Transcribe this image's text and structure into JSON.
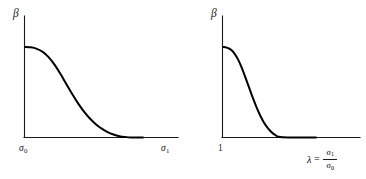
{
  "figure": {
    "background_color": "#ffffff",
    "ink_color": "#000000",
    "panel_count": 2
  },
  "panels": [
    {
      "id": "left",
      "y_axis_label": "β",
      "x_axis_start_label": "σ",
      "x_axis_start_label_sub": "0",
      "x_axis_end_label": "σ",
      "x_axis_end_label_sub": "1"
    },
    {
      "id": "right",
      "y_axis_label": "β",
      "x_axis_start_label": "1",
      "x_axis_expression": {
        "variable": "λ",
        "equals": "=",
        "numerator": "σ",
        "numerator_sub": "1",
        "denominator": "σ",
        "denominator_sub": "0"
      }
    }
  ],
  "chart_data": [
    {
      "type": "line",
      "id": "beta-vs-sigma",
      "title": "",
      "xlabel": "σ",
      "ylabel": "β",
      "xlim": [
        0,
        1
      ],
      "ylim": [
        0,
        1
      ],
      "grid": false,
      "legend": "none",
      "xtick_labels": [
        "σ₀",
        "σ₁"
      ],
      "xtick_values": [
        0,
        1
      ],
      "ytick_labels": [],
      "annotations": [],
      "series": [
        {
          "name": "β",
          "description": "smooth sigmoid (ogive) decay from a plateau near σ₀ to zero before σ₁",
          "x": [
            0.0,
            0.05,
            0.1,
            0.15,
            0.2,
            0.25,
            0.3,
            0.35,
            0.4,
            0.45,
            0.5,
            0.55,
            0.6,
            0.65,
            0.7,
            0.75,
            0.8,
            0.85,
            0.9,
            1.0
          ],
          "y": [
            0.745,
            0.742,
            0.73,
            0.705,
            0.662,
            0.6,
            0.524,
            0.441,
            0.358,
            0.281,
            0.213,
            0.156,
            0.11,
            0.073,
            0.045,
            0.025,
            0.011,
            0.004,
            0.0,
            0.0
          ]
        }
      ]
    },
    {
      "type": "line",
      "id": "beta-vs-lambda",
      "title": "",
      "xlabel": "λ = σ₁/σ₀",
      "ylabel": "β",
      "xlim": [
        0,
        1
      ],
      "ylim": [
        0,
        1
      ],
      "grid": false,
      "legend": "none",
      "xtick_labels": [
        "1"
      ],
      "xtick_values": [
        0
      ],
      "ytick_labels": [],
      "annotations": [],
      "series": [
        {
          "name": "β",
          "description": "smooth sigmoid (ogive) decay from a plateau at λ = 1 to zero, reaching the axis earlier than the left panel",
          "x": [
            0.0,
            0.04,
            0.08,
            0.12,
            0.16,
            0.2,
            0.24,
            0.28,
            0.32,
            0.36,
            0.4,
            0.44,
            0.48,
            0.52,
            0.56,
            0.6,
            0.7,
            0.8,
            1.0
          ],
          "y": [
            0.745,
            0.74,
            0.725,
            0.695,
            0.645,
            0.578,
            0.497,
            0.412,
            0.328,
            0.25,
            0.181,
            0.124,
            0.079,
            0.045,
            0.021,
            0.006,
            0.0,
            0.0,
            0.0
          ]
        }
      ]
    }
  ]
}
